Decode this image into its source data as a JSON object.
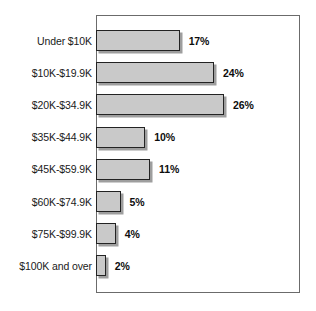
{
  "chart_data": {
    "type": "bar",
    "orientation": "horizontal",
    "title": "",
    "subtitle": "",
    "xlabel": "",
    "ylabel": "",
    "grid": false,
    "legend": null,
    "xlim": [
      0,
      30
    ],
    "categories": [
      "Under $10K",
      "$10K-$19.9K",
      "$20K-$34.9K",
      "$35K-$44.9K",
      "$45K-$59.9K",
      "$60K-$74.9K",
      "$75K-$99.9K",
      "$100K and over"
    ],
    "values": [
      17,
      24,
      26,
      10,
      11,
      5,
      4,
      2
    ],
    "value_labels": [
      "17%",
      "24%",
      "26%",
      "10%",
      "11%",
      "5%",
      "4%",
      "2%"
    ],
    "colors": {
      "bar_fill": "#c9c9c9",
      "bar_border": "#232323",
      "bar_shadow": "#787878",
      "frame_border": "#6b6b6b",
      "background": "#ffffff",
      "label_text": "#1a1a1a",
      "value_text": "#0d0d0d"
    }
  },
  "rows": [
    {
      "label": "Under $10K",
      "value": 17,
      "value_label": "17%"
    },
    {
      "label": "$10K-$19.9K",
      "value": 24,
      "value_label": "24%"
    },
    {
      "label": "$20K-$34.9K",
      "value": 26,
      "value_label": "26%"
    },
    {
      "label": "$35K-$44.9K",
      "value": 10,
      "value_label": "10%"
    },
    {
      "label": "$45K-$59.9K",
      "value": 11,
      "value_label": "11%"
    },
    {
      "label": "$60K-$74.9K",
      "value": 5,
      "value_label": "5%"
    },
    {
      "label": "$75K-$99.9K",
      "value": 4,
      "value_label": "4%"
    },
    {
      "label": "$100K and over",
      "value": 2,
      "value_label": "2%"
    }
  ]
}
